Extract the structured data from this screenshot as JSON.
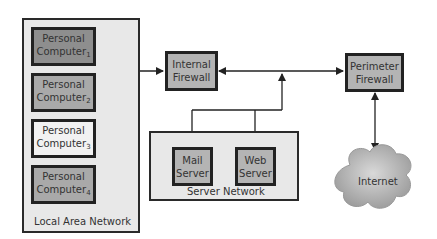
{
  "diagram": {
    "lan": {
      "label": "Local Area Network",
      "computers": [
        {
          "name": "Personal",
          "line2": "Computer",
          "index": "1",
          "fill": "#8e8e8e"
        },
        {
          "name": "Personal",
          "line2": "Computer",
          "index": "2",
          "fill": "#a9a9a9"
        },
        {
          "name": "Personal",
          "line2": "Computer",
          "index": "3",
          "fill": "#f2f2f2"
        },
        {
          "name": "Personal",
          "line2": "Computer",
          "index": "4",
          "fill": "#a9a9a9"
        }
      ]
    },
    "internal_firewall": {
      "line1": "Internal",
      "line2": "Firewall"
    },
    "perimeter_firewall": {
      "line1": "Perimeter",
      "line2": "Firewall"
    },
    "server_network": {
      "label": "Server Network",
      "mail_server": {
        "line1": "Mail",
        "line2": "Server"
      },
      "web_server": {
        "line1": "Web",
        "line2": "Server"
      }
    },
    "internet": {
      "label": "Internet"
    },
    "colors": {
      "frame_fill": "#e8e8e8",
      "border": "#222222",
      "firewall_fill": "#b4b4b4",
      "cloud_fill": "#b0b0b0"
    }
  }
}
